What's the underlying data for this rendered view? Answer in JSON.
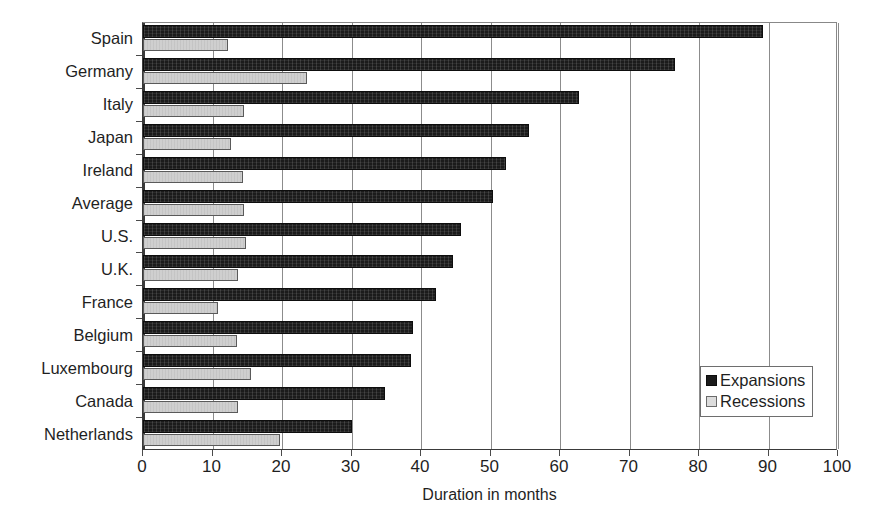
{
  "chart_data": {
    "type": "bar",
    "orientation": "horizontal",
    "title": "",
    "xlabel": "Duration in months",
    "ylabel": "",
    "xlim": [
      0,
      100
    ],
    "xticks": [
      0,
      10,
      20,
      30,
      40,
      50,
      60,
      70,
      80,
      90,
      100
    ],
    "grid": true,
    "legend_position": "inside-bottom-right",
    "categories": [
      "Spain",
      "Germany",
      "Italy",
      "Japan",
      "Ireland",
      "Average",
      "U.S.",
      "U.K.",
      "France",
      "Belgium",
      "Luxembourg",
      "Canada",
      "Netherlands"
    ],
    "series": [
      {
        "name": "Expansions",
        "color": "#1b1b1b",
        "values": [
          89.2,
          76.5,
          62.8,
          55.6,
          52.2,
          50.4,
          45.7,
          44.6,
          42.1,
          38.8,
          38.6,
          34.8,
          30.1
        ]
      },
      {
        "name": "Recessions",
        "color": "#cfcfcf",
        "values": [
          12.3,
          23.6,
          14.6,
          12.6,
          14.4,
          14.5,
          14.8,
          13.6,
          10.8,
          13.5,
          15.6,
          13.6,
          19.7
        ]
      }
    ]
  },
  "legend": {
    "items": [
      {
        "label": "Expansions",
        "swatch": "expansions-swatch"
      },
      {
        "label": "Recessions",
        "swatch": "recessions-swatch"
      }
    ]
  },
  "axis": {
    "x_title": "Duration in months"
  }
}
